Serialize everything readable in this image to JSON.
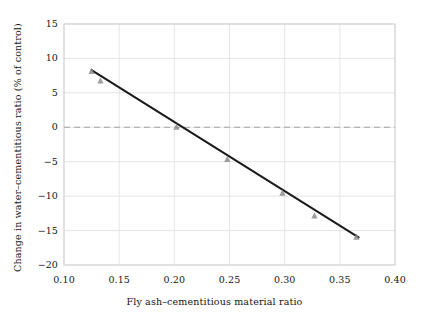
{
  "chart_data": {
    "type": "scatter",
    "title": "",
    "xlabel": "Fly ash–cementitious material ratio",
    "ylabel": "Change in water–cementitious ratio (% of control)",
    "xlim": [
      0.1,
      0.4
    ],
    "ylim": [
      -20,
      15
    ],
    "xticks": [
      0.1,
      0.15,
      0.2,
      0.25,
      0.3,
      0.35,
      0.4
    ],
    "xtick_labels": [
      "0.10",
      "0.15",
      "0.20",
      "0.25",
      "0.30",
      "0.35",
      "0.40"
    ],
    "yticks": [
      15,
      10,
      5,
      0,
      -5,
      -10,
      -15,
      -20
    ],
    "ytick_labels": [
      "15",
      "10",
      "5",
      "0",
      "−5",
      "−10",
      "−15",
      "−20"
    ],
    "grid": true,
    "grid_color": "#e2e2e2",
    "legend": null,
    "points": [
      {
        "x": 0.125,
        "y": 8.2
      },
      {
        "x": 0.133,
        "y": 6.8
      },
      {
        "x": 0.202,
        "y": 0.1
      },
      {
        "x": 0.248,
        "y": -4.6
      },
      {
        "x": 0.298,
        "y": -9.5
      },
      {
        "x": 0.327,
        "y": -12.8
      },
      {
        "x": 0.365,
        "y": -15.9
      }
    ],
    "marker_color": "#8c8c8c",
    "trend_line": {
      "x_start": 0.125,
      "y_start": 8.3,
      "x_end": 0.367,
      "y_end": -16.0,
      "color": "#1a1a1a",
      "width": 2.0
    },
    "reference_line": {
      "y": 0,
      "style": "dashed",
      "color": "#b4b4b4",
      "width": 1.2
    },
    "frame_color": "#d0d0d0",
    "background": "#ffffff"
  }
}
